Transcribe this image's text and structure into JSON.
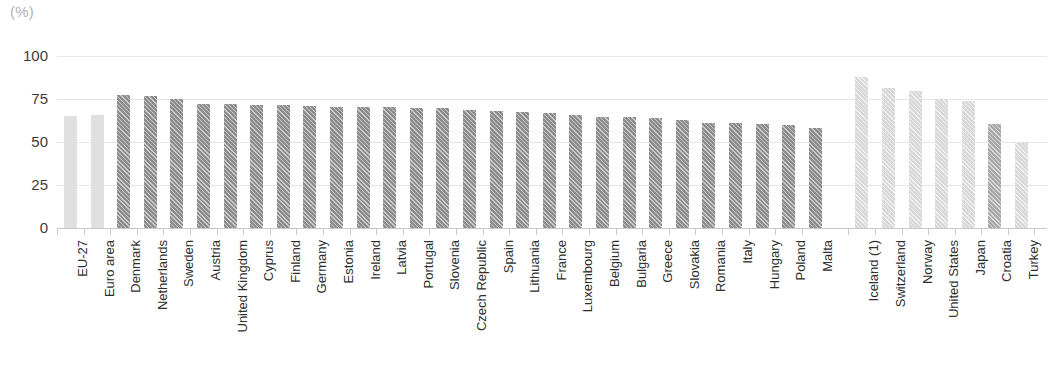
{
  "chart_data": {
    "type": "bar",
    "title": "",
    "subtitle": "",
    "unit_label": "(%)",
    "xlabel": "",
    "ylabel": "",
    "ylim": [
      0,
      100
    ],
    "yticks": [
      0,
      25,
      50,
      75,
      100
    ],
    "grid": true,
    "legend": "none",
    "categories": [
      "EU-27",
      "Euro area",
      "Denmark",
      "Netherlands",
      "Sweden",
      "Austria",
      "United Kingdom",
      "Cyprus",
      "Finland",
      "Germany",
      "Estonia",
      "Ireland",
      "Latvia",
      "Portugal",
      "Slovenia",
      "Czech Republic",
      "Spain",
      "Lithuania",
      "France",
      "Luxembourg",
      "Belgium",
      "Bulgaria",
      "Greece",
      "Slovakia",
      "Romania",
      "Italy",
      "Hungary",
      "Poland",
      "Malta",
      "Iceland (1)",
      "Switzerland",
      "Norway",
      "United States",
      "Japan",
      "Croatia",
      "Turkey"
    ],
    "values": [
      65,
      65.5,
      77.5,
      76.5,
      75.2,
      72.2,
      72.0,
      71.6,
      71.4,
      70.8,
      70.6,
      70.5,
      70.1,
      69.7,
      69.6,
      68.4,
      68.1,
      67.3,
      66.6,
      65.8,
      64.5,
      64.3,
      64.0,
      63.0,
      61.3,
      61.2,
      60.4,
      59.8,
      58.0,
      88.0,
      81.2,
      79.8,
      75.0,
      74.0,
      60.5,
      49.3
    ],
    "styles": [
      "light",
      "light",
      "dark",
      "dark",
      "dark",
      "dark",
      "dark",
      "dark",
      "dark",
      "dark",
      "dark",
      "dark",
      "dark",
      "dark",
      "dark",
      "dark",
      "dark",
      "dark",
      "dark",
      "dark",
      "dark",
      "dark",
      "dark",
      "dark",
      "dark",
      "dark",
      "dark",
      "dark",
      "dark",
      "lighthatch",
      "lighthatch",
      "lighthatch",
      "lighthatch",
      "lighthatch",
      "medhatch",
      "lighthatch"
    ],
    "colors": {
      "aggregate_bar": "#e0e0e0",
      "eu_member_bar": "#8c8c8c",
      "non_eu_bar": "#d8d8d8",
      "croatia_bar": "#a8a8a8",
      "gridline": "#e6e6e6",
      "baseline": "#c9c9c9",
      "tick_text": "#3c3c3c",
      "category_text": "#2e2e2e",
      "unit_text": "#b3b3b3"
    },
    "gap_after_index": 28
  }
}
